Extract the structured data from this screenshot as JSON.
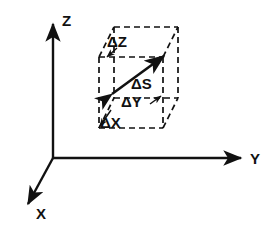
{
  "figure": {
    "type": "3d-axes-diagram",
    "title": "",
    "background_color": "#ffffff",
    "stroke_color": "#111111"
  },
  "axes": {
    "origin": {
      "x": 53,
      "y": 158
    },
    "items": [
      {
        "key": "z",
        "label": "Z",
        "label_x": 62,
        "label_y": 24,
        "line": {
          "x1": 53,
          "y1": 158,
          "x2": 53,
          "y2": 22
        },
        "arrow": "up"
      },
      {
        "key": "y",
        "label": "Y",
        "label_x": 250,
        "label_y": 164,
        "line": {
          "x1": 53,
          "y1": 158,
          "x2": 243,
          "y2": 158
        },
        "arrow": "right"
      },
      {
        "key": "x",
        "label": "X",
        "label_x": 36,
        "label_y": 218,
        "line": {
          "x1": 53,
          "y1": 158,
          "x2": 26,
          "y2": 206
        },
        "arrow": "down-left"
      }
    ]
  },
  "cube": {
    "style": "dashed",
    "front_face": {
      "left": 99,
      "right": 163,
      "top": 57,
      "bottom": 128
    },
    "depth_offset": {
      "dx": 15,
      "dy": -30
    },
    "back_face": {
      "left": 114,
      "right": 178,
      "top": 27,
      "bottom": 98
    }
  },
  "vector": {
    "name": "delta-s",
    "label": "ΔS",
    "label_x": 132,
    "label_y": 86,
    "start": {
      "x": 110,
      "y": 95
    },
    "end": {
      "x": 167,
      "y": 53
    },
    "style": "solid",
    "double_headed": true
  },
  "labels": [
    {
      "key": "delta_z",
      "text": "ΔZ",
      "x": 108,
      "y": 45,
      "leader": {
        "x1": 117,
        "y1": 48,
        "x2": 106,
        "y2": 58
      }
    },
    {
      "key": "delta_y",
      "text": "ΔY",
      "x": 122,
      "y": 106,
      "leader": {
        "x1": 150,
        "y1": 104,
        "x2": 160,
        "y2": 96
      }
    },
    {
      "key": "delta_x",
      "text": "ΔX",
      "x": 101,
      "y": 126,
      "leader": {
        "x1": 110,
        "y1": 110,
        "x2": 99,
        "y2": 127
      }
    }
  ]
}
